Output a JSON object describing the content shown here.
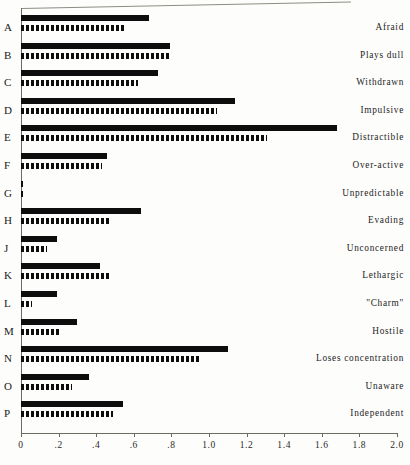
{
  "chart_data": {
    "type": "bar",
    "orientation": "horizontal",
    "title": "",
    "xlabel": "",
    "ylabel": "",
    "xlim": [
      0,
      2.0
    ],
    "xticks": [
      0,
      0.2,
      0.4,
      0.6,
      0.8,
      1.0,
      1.2,
      1.4,
      1.6,
      1.8,
      2.0
    ],
    "xticklabels": [
      "0",
      ".2",
      ".4",
      ".6",
      ".8",
      "1.0",
      "1.2",
      "1.4",
      "1.6",
      "1.8",
      "2.0"
    ],
    "grid": false,
    "legend": "none",
    "categories": [
      "A",
      "B",
      "C",
      "D",
      "E",
      "F",
      "G",
      "H",
      "J",
      "K",
      "L",
      "M",
      "N",
      "O",
      "P"
    ],
    "category_labels": [
      "Afraid",
      "Plays dull",
      "Withdrawn",
      "Impulsive",
      "Distractible",
      "Over-active",
      "Unpredictable",
      "Evading",
      "Unconcerned",
      "Lethargic",
      "\"Charm\"",
      "Hostile",
      "Loses concentration",
      "Unaware",
      "Independent"
    ],
    "series": [
      {
        "name": "solid",
        "style": "solid-black",
        "values": [
          0.68,
          0.79,
          0.73,
          1.14,
          1.68,
          0.46,
          0.01,
          0.64,
          0.19,
          0.42,
          0.19,
          0.3,
          1.1,
          0.36,
          0.54
        ]
      },
      {
        "name": "dashed",
        "style": "dashed-black",
        "values": [
          0.56,
          0.8,
          0.62,
          1.04,
          1.31,
          0.43,
          0.01,
          0.48,
          0.14,
          0.48,
          0.06,
          0.2,
          0.96,
          0.27,
          0.49
        ]
      }
    ]
  },
  "axis": {
    "origin_value": 0,
    "max_value": 2.0
  }
}
